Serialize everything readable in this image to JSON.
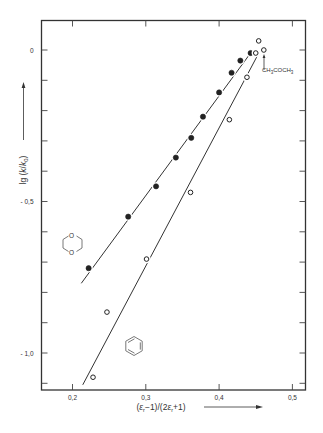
{
  "chart_data": {
    "type": "scatter",
    "title": "",
    "xlabel": "(εr−1)/(2εr+1)",
    "ylabel": "lg (k/k0)",
    "xlim": [
      0.16,
      0.52
    ],
    "ylim": [
      -1.125,
      0.1
    ],
    "x_ticks": [
      0.2,
      0.3,
      0.4,
      0.5
    ],
    "x_tick_labels": [
      "0,2",
      "0,3",
      "0,4",
      "0,5"
    ],
    "y_ticks": [
      0,
      -0.5,
      -1.0
    ],
    "y_tick_labels": [
      "0",
      "- 0,5",
      "- 1,0"
    ],
    "y_minor_step": 0.1,
    "grid": false,
    "legend": "none (molecule structure glyphs mark each series)",
    "series": [
      {
        "name": "dioxane mixtures",
        "marker": "filled-circle",
        "glyph": "1,4-dioxane ring",
        "x": [
          0.222,
          0.276,
          0.314,
          0.341,
          0.362,
          0.378,
          0.4,
          0.417,
          0.429,
          0.443
        ],
        "y": [
          -0.72,
          -0.55,
          -0.45,
          -0.355,
          -0.29,
          -0.22,
          -0.14,
          -0.075,
          -0.035,
          -0.01
        ],
        "fit_line": {
          "x": [
            0.212,
            0.443
          ],
          "y": [
            -0.77,
            -0.01
          ]
        }
      },
      {
        "name": "benzene mixtures",
        "marker": "open-circle",
        "glyph": "benzene ring",
        "x": [
          0.228,
          0.247,
          0.301,
          0.361,
          0.414,
          0.438,
          0.45,
          0.454
        ],
        "y": [
          -1.08,
          -0.865,
          -0.69,
          -0.47,
          -0.23,
          -0.09,
          -0.01,
          0.03
        ],
        "fit_line": {
          "x": [
            0.214,
            0.452
          ],
          "y": [
            -1.105,
            -0.02
          ]
        }
      },
      {
        "name": "CH3COCH3",
        "marker": "open-circle",
        "x": [
          0.461
        ],
        "y": [
          0.0
        ]
      }
    ],
    "annotations": [
      {
        "text": "CH3COCH3",
        "x": 0.461,
        "y": -0.06,
        "arrow_to": [
          0.461,
          -0.01
        ]
      }
    ]
  },
  "labels": {
    "x_axis": "(εr−1)/(2εr+1)",
    "y_axis_prefix": "lg (",
    "y_axis_k": "k",
    "y_axis_slash": "/",
    "y_axis_k0": "k",
    "y_axis_sub": "0",
    "y_axis_suffix": ")",
    "annotation_main": "CH",
    "annotation_full": "CH3COCH3"
  },
  "colors": {
    "ink": "#333333",
    "background": "#ffffff"
  }
}
